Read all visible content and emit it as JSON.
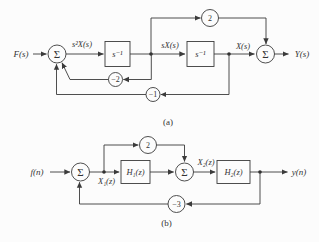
{
  "figure": {
    "diagram_a": {
      "caption": "(a)",
      "input_label": "F(s)",
      "output_label": "Y(s)",
      "sum1_symbol": "Σ",
      "sum2_symbol": "Σ",
      "signal_s2X": "s²X(s)",
      "signal_sX": "sX(s)",
      "signal_X": "X(s)",
      "block1_label": "s⁻¹",
      "block2_label": "s⁻¹",
      "gain_feedforward": "2",
      "gain_feedback_inner": "−2",
      "gain_feedback_outer": "−1"
    },
    "diagram_b": {
      "caption": "(b)",
      "input_label": "f(n)",
      "output_label": "y(n)",
      "sum1_symbol": "Σ",
      "sum2_symbol": "Σ",
      "signal_X1": "X₁(z)",
      "signal_X2": "X₂(z)",
      "block1_label": "H₁(z)",
      "block2_label": "H₂(z)",
      "gain_feedforward": "2",
      "gain_feedback": "−3"
    },
    "colors": {
      "line": "#3b3b3b",
      "text": "#333333",
      "background": "#fcfcfc"
    }
  }
}
